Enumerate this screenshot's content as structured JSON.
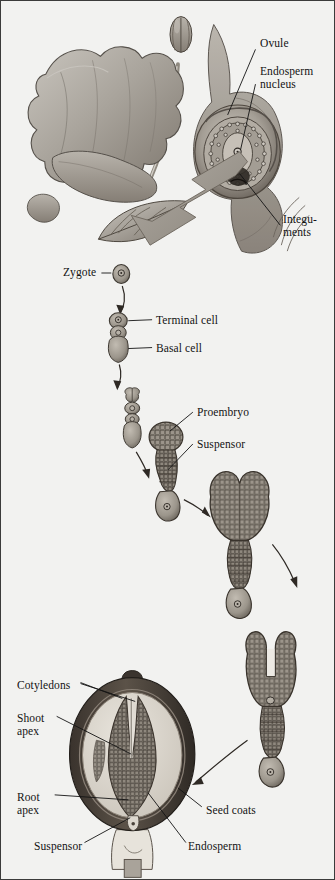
{
  "figure": {
    "background_color": "#f2f2f0",
    "border_color": "#3b3b3b",
    "ink_color": "#131313",
    "tissue_fill": "#a9a59f",
    "tissue_dark": "#585048",
    "arrow_fill": "#9a958e",
    "seedcoat_color": "#4a423c",
    "endosperm_color": "#dedad2"
  },
  "labels": [
    {
      "id": "ovule",
      "text": "Ovule",
      "x": 259,
      "y": 42,
      "align": "left"
    },
    {
      "id": "endosperm-nucleus",
      "text": "Endosperm\nnucleus",
      "x": 259,
      "y": 70,
      "align": "left"
    },
    {
      "id": "integuments",
      "text": "Integu-\nments",
      "x": 282,
      "y": 218,
      "align": "left"
    },
    {
      "id": "zygote",
      "text": "Zygote",
      "x": 65,
      "y": 267,
      "align": "left"
    },
    {
      "id": "terminal-cell",
      "text": "Terminal cell",
      "x": 155,
      "y": 315,
      "align": "left"
    },
    {
      "id": "basal-cell",
      "text": "Basal cell",
      "x": 155,
      "y": 343,
      "align": "left"
    },
    {
      "id": "proembryo",
      "text": "Proembryo",
      "x": 196,
      "y": 409,
      "align": "left"
    },
    {
      "id": "suspensor-top",
      "text": "Suspensor",
      "x": 196,
      "y": 440,
      "align": "left"
    },
    {
      "id": "cotyledons",
      "text": "Cotyledons",
      "x": 18,
      "y": 681,
      "align": "left"
    },
    {
      "id": "shoot-apex",
      "text": "Shoot\napex",
      "x": 18,
      "y": 714,
      "align": "left"
    },
    {
      "id": "root-apex",
      "text": "Root\napex",
      "x": 18,
      "y": 793,
      "align": "left"
    },
    {
      "id": "seed-coats",
      "text": "Seed coats",
      "x": 205,
      "y": 806,
      "align": "left"
    },
    {
      "id": "suspensor-bottom",
      "text": "Suspensor",
      "x": 36,
      "y": 845,
      "align": "left"
    },
    {
      "id": "endosperm",
      "text": "Endosperm",
      "x": 189,
      "y": 845,
      "align": "left"
    }
  ],
  "stages": [
    {
      "id": "flower-ovule",
      "name": "Flower with ovule and endosperm nucleus"
    },
    {
      "id": "zygote",
      "name": "Zygote"
    },
    {
      "id": "two-cell",
      "name": "Two-celled stage: terminal cell and basal cell"
    },
    {
      "id": "four-cell",
      "name": "Four-celled proembryo with suspensor"
    },
    {
      "id": "globular",
      "name": "Globular proembryo with suspensor"
    },
    {
      "id": "heart",
      "name": "Heart-stage embryo"
    },
    {
      "id": "torpedo",
      "name": "Torpedo-stage embryo with cotyledons"
    },
    {
      "id": "mature-seed",
      "name": "Mature seed cross-section"
    }
  ]
}
